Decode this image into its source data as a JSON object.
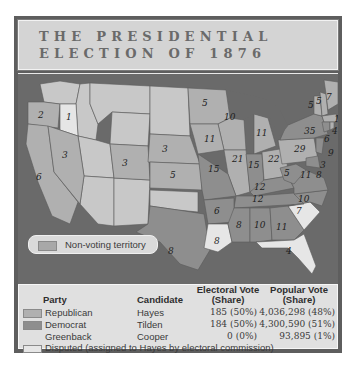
{
  "title": {
    "line1": "THE PRESIDENTIAL",
    "line2": "ELECTION OF 1876"
  },
  "colors": {
    "republican": "#b0b0b0",
    "democrat": "#8e8e8e",
    "disputed": "#e6e6e6",
    "non_voting": "#bfbfbf",
    "water": "#6a6a6a",
    "frame": "#5e5e5e"
  },
  "map": {
    "legend_label": "Non-voting territory",
    "electoral_votes": [
      {
        "state": "OR",
        "value": "2"
      },
      {
        "state": "OR-disputed",
        "value": "1"
      },
      {
        "state": "CA",
        "value": "6"
      },
      {
        "state": "NV",
        "value": "3"
      },
      {
        "state": "CO",
        "value": "3"
      },
      {
        "state": "NE",
        "value": "3"
      },
      {
        "state": "KS",
        "value": "5"
      },
      {
        "state": "MN",
        "value": "5"
      },
      {
        "state": "TX",
        "value": "8"
      },
      {
        "state": "WI",
        "value": "10"
      },
      {
        "state": "MI",
        "value": "11"
      },
      {
        "state": "IA",
        "value": "11"
      },
      {
        "state": "IL",
        "value": "21"
      },
      {
        "state": "IN",
        "value": "15"
      },
      {
        "state": "MO",
        "value": "15"
      },
      {
        "state": "OH",
        "value": "22"
      },
      {
        "state": "KY",
        "value": "12"
      },
      {
        "state": "TN",
        "value": "12"
      },
      {
        "state": "AR",
        "value": "6"
      },
      {
        "state": "LA",
        "value": "8"
      },
      {
        "state": "MS",
        "value": "8"
      },
      {
        "state": "AL",
        "value": "10"
      },
      {
        "state": "GA",
        "value": "11"
      },
      {
        "state": "FL",
        "value": "4"
      },
      {
        "state": "SC",
        "value": "7"
      },
      {
        "state": "NC",
        "value": "10"
      },
      {
        "state": "VA",
        "value": "11"
      },
      {
        "state": "WV",
        "value": "5"
      },
      {
        "state": "PA",
        "value": "29"
      },
      {
        "state": "NY",
        "value": "35"
      },
      {
        "state": "VT",
        "value": "5"
      },
      {
        "state": "NH",
        "value": "5"
      },
      {
        "state": "ME",
        "value": "7"
      },
      {
        "state": "MA",
        "value": "13"
      },
      {
        "state": "RI",
        "value": "4"
      },
      {
        "state": "CT",
        "value": "6"
      },
      {
        "state": "NJ",
        "value": "9"
      },
      {
        "state": "DE",
        "value": "3"
      },
      {
        "state": "MD",
        "value": "8"
      }
    ]
  },
  "table": {
    "headers": {
      "party": "Party",
      "candidate": "Candidate",
      "electoral_line1": "Electoral Vote",
      "electoral_line2": "(Share)",
      "popular_line1": "Popular Vote",
      "popular_line2": "(Share)"
    },
    "rows": [
      {
        "party": "Republican",
        "candidate": "Hayes",
        "electoral": "185 (50%)",
        "popular": "4,036,298 (48%)"
      },
      {
        "party": "Democrat",
        "candidate": "Tilden",
        "electoral": "184 (50%)",
        "popular": "4,300,590 (51%)"
      },
      {
        "party": "Greenback",
        "candidate": "Cooper",
        "electoral": "0 (0%)",
        "popular": "93,895 (1%)"
      }
    ],
    "disputed_note": "Disputed (assigned to Hayes by electoral commission)"
  }
}
